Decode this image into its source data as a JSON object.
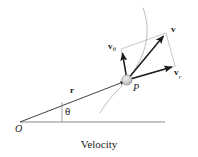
{
  "figure": {
    "caption": "Velocity",
    "background_color": "#ffffff",
    "ink_color": "#1a1a1a",
    "construction_line_color": "#9a9a9a",
    "trajectory_color": "#b5b5b5",
    "particle_fill": "#c9c9c9"
  },
  "labels": {
    "velocity": "v",
    "velocity_radial": "v",
    "velocity_radial_sub": "r",
    "velocity_transverse": "v",
    "velocity_transverse_sub": "θ",
    "position_vector": "r",
    "angle": "θ",
    "point": "P",
    "origin": "O"
  },
  "geometry": {
    "origin": [
      20,
      122
    ],
    "particle": [
      127,
      80
    ],
    "baseline_end": [
      165,
      122
    ],
    "velocity_tip": [
      166,
      33
    ],
    "velocity_radial_tip": [
      175,
      66
    ],
    "velocity_transverse_tip": [
      121,
      49
    ],
    "trajectory_start": [
      143,
      8
    ],
    "trajectory_end": [
      100,
      113
    ],
    "theta_tick": [
      62,
      103
    ]
  }
}
